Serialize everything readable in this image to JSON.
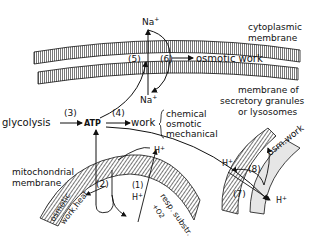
{
  "diagram": {
    "labels": {
      "na_top": "Na",
      "na_bottom": "Na",
      "plus": "+",
      "step1": "(1)",
      "step2": "(2)",
      "step3": "(3)",
      "step4": "(4)",
      "step5": "(5)",
      "step6": "(6)",
      "step7": "(7)",
      "step8": "(8)",
      "osmotic_work_top": "osmotic work",
      "cyto_line1": "cytoplasmic",
      "cyto_line2": "membrane",
      "secretory_line1": "membrane of",
      "secretory_line2": "secretory granules",
      "secretory_line3": "or lysosomes",
      "glycolysis": "glycolysis",
      "atp": "ATP",
      "work": "work",
      "work_chemical": "chemical",
      "work_osmotic": "osmotic",
      "work_mechanical": "mechanical",
      "mito_line1": "mitochondrial",
      "mito_line2": "membrane",
      "osmotic_curved": "osmotic",
      "work_heat": "work,heat",
      "resp_substr": "resp. substr.",
      "plus_o2": "+O2",
      "h_plus": "H",
      "osm_work": "osm.work"
    },
    "colors": {
      "ink": "#111111",
      "background": "#ffffff",
      "membrane_fill": "#d9d9d9"
    }
  }
}
